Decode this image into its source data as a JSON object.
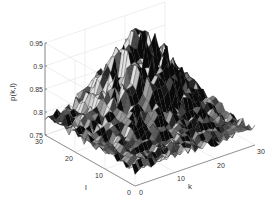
{
  "chart_data": {
    "type": "surface3d",
    "title": "",
    "xlabel": "k",
    "ylabel": "l",
    "zlabel": "p(k,l)",
    "xlim": [
      0,
      30
    ],
    "ylim": [
      0,
      30
    ],
    "zlim": [
      0.75,
      0.95
    ],
    "x_ticks": [
      "0",
      "10",
      "20",
      "30"
    ],
    "y_ticks": [
      "0",
      "10",
      "20",
      "30"
    ],
    "z_ticks": [
      "0.75",
      "0.8",
      "0.85",
      "0.9",
      "0.95"
    ],
    "grid": true,
    "colormap": "gray",
    "grid_size": 30,
    "peak_center": [
      18,
      22
    ],
    "base_value": 0.785,
    "peak_value": 0.93
  },
  "axes": {
    "zlabel": "p(k,l)",
    "xlabel": "k",
    "ylabel": "l"
  }
}
